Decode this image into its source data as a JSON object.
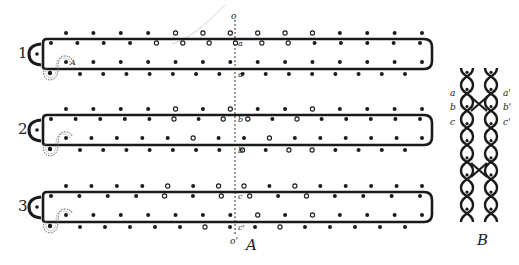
{
  "figure": {
    "panel_a_label": "A",
    "panel_b_label": "B",
    "axis_top_label": "o",
    "axis_bottom_label": "o'",
    "colors": {
      "ink": "#1a1a1a",
      "background": "#ffffff",
      "stroke_gray": "#888888"
    },
    "legend": {
      "filled": "solid dot",
      "open": "open circle"
    },
    "rows": [
      {
        "number": "1",
        "upper_label": "a",
        "lower_label": "a'",
        "outer_top": "ffffoooo.ooffff",
        "inner_top": "ffffoooooofffff",
        "inner_bottom": "affffff.fffffff",
        "outer_bottom": "ffffffff.fffffff"
      },
      {
        "number": "2",
        "upper_label": "b",
        "lower_label": "b'",
        "outer_top": "ffffofoffoffff",
        "inner_top": "fffffofoofofffff",
        "inner_bottom": "fffffoffoffffff",
        "outer_bottom": "fffffffofooffff"
      },
      {
        "number": "3",
        "upper_label": "c",
        "lower_label": "c'",
        "outer_top": "ffffofoofofffff",
        "inner_top": "ffffofoofoffff",
        "inner_bottom": "fffffffofoffff",
        "outer_bottom": "fffffoffofffff"
      }
    ],
    "panel_b": {
      "left_labels": [
        "a",
        "b",
        "c"
      ],
      "right_labels": [
        "a'",
        "b'",
        "c'"
      ]
    }
  }
}
